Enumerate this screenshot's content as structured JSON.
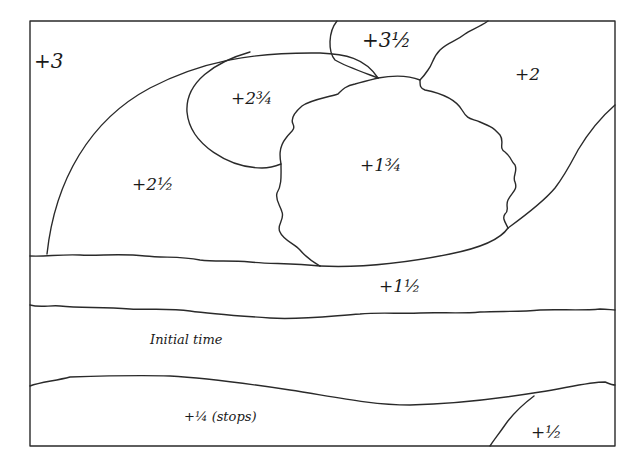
{
  "diagram": {
    "type": "darkroom exposure map (dodge and burn)",
    "stroke_color": "#2a2a2a",
    "background": "#ffffff",
    "zones": [
      {
        "id": "z-3",
        "label": "+3",
        "x": 34,
        "y": 57
      },
      {
        "id": "z-3-1-2",
        "label": "+3½",
        "x": 362,
        "y": 32
      },
      {
        "id": "z-2",
        "label": "+2",
        "x": 515,
        "y": 66
      },
      {
        "id": "z-2-3-4",
        "label": "+2¾",
        "x": 232,
        "y": 89
      },
      {
        "id": "z-2-1-2",
        "label": "+2½",
        "x": 133,
        "y": 174
      },
      {
        "id": "z-1-3-4",
        "label": "+1¾",
        "x": 360,
        "y": 158
      },
      {
        "id": "z-1-1-2",
        "label": "+1½",
        "x": 379,
        "y": 280
      },
      {
        "id": "z-initial",
        "label": "Initial time",
        "x": 149,
        "y": 337
      },
      {
        "id": "z-1-4",
        "label": "+¼ (stops)",
        "x": 184,
        "y": 412
      },
      {
        "id": "z-1-2",
        "label": "+½",
        "x": 531,
        "y": 428
      }
    ]
  }
}
